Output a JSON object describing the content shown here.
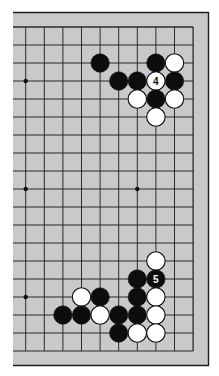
{
  "diagram": {
    "title": "",
    "board": {
      "size": 19,
      "visible_columns": [
        10,
        19
      ],
      "visible_rows": [
        1,
        19
      ],
      "board_color": "#c9c9c9",
      "line_color": "#2a2a2a",
      "border_color": "#1e1e1e",
      "star_points": [
        {
          "col": 10,
          "row": 4
        },
        {
          "col": 10,
          "row": 10
        },
        {
          "col": 16,
          "row": 10
        },
        {
          "col": 10,
          "row": 16
        }
      ]
    },
    "stones": [
      {
        "col": 14,
        "row": 3,
        "color": "black",
        "label": ""
      },
      {
        "col": 17,
        "row": 3,
        "color": "black",
        "label": ""
      },
      {
        "col": 18,
        "row": 3,
        "color": "white",
        "label": ""
      },
      {
        "col": 15,
        "row": 4,
        "color": "black",
        "label": ""
      },
      {
        "col": 16,
        "row": 4,
        "color": "black",
        "label": ""
      },
      {
        "col": 17,
        "row": 4,
        "color": "white",
        "label": "4"
      },
      {
        "col": 18,
        "row": 4,
        "color": "black",
        "label": ""
      },
      {
        "col": 16,
        "row": 5,
        "color": "white",
        "label": ""
      },
      {
        "col": 17,
        "row": 5,
        "color": "black",
        "label": ""
      },
      {
        "col": 18,
        "row": 5,
        "color": "white",
        "label": ""
      },
      {
        "col": 17,
        "row": 6,
        "color": "white",
        "label": ""
      },
      {
        "col": 17,
        "row": 14,
        "color": "white",
        "label": ""
      },
      {
        "col": 16,
        "row": 15,
        "color": "black",
        "label": ""
      },
      {
        "col": 17,
        "row": 15,
        "color": "black",
        "label": "5"
      },
      {
        "col": 13,
        "row": 16,
        "color": "white",
        "label": ""
      },
      {
        "col": 14,
        "row": 16,
        "color": "black",
        "label": ""
      },
      {
        "col": 16,
        "row": 16,
        "color": "black",
        "label": ""
      },
      {
        "col": 17,
        "row": 16,
        "color": "white",
        "label": ""
      },
      {
        "col": 12,
        "row": 17,
        "color": "black",
        "label": ""
      },
      {
        "col": 13,
        "row": 17,
        "color": "black",
        "label": ""
      },
      {
        "col": 14,
        "row": 17,
        "color": "white",
        "label": ""
      },
      {
        "col": 15,
        "row": 17,
        "color": "black",
        "label": ""
      },
      {
        "col": 16,
        "row": 17,
        "color": "black",
        "label": ""
      },
      {
        "col": 17,
        "row": 17,
        "color": "white",
        "label": ""
      },
      {
        "col": 15,
        "row": 18,
        "color": "black",
        "label": ""
      },
      {
        "col": 16,
        "row": 18,
        "color": "white",
        "label": ""
      },
      {
        "col": 17,
        "row": 18,
        "color": "white",
        "label": ""
      }
    ],
    "move_labels": [
      {
        "number": "4",
        "stone_color": "white",
        "col": 17,
        "row": 4
      },
      {
        "number": "5",
        "stone_color": "black",
        "col": 17,
        "row": 15
      }
    ]
  }
}
